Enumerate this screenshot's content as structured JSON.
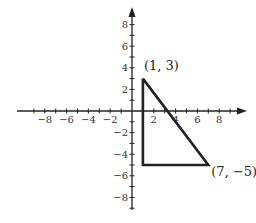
{
  "chart_data": {
    "type": "line",
    "title": "",
    "xlabel": "",
    "ylabel": "",
    "xlim": [
      -9.5,
      9.5
    ],
    "ylim": [
      -9.5,
      9.5
    ],
    "grid": false,
    "x_ticks": [
      -8,
      -6,
      -4,
      -2,
      2,
      4,
      6,
      8
    ],
    "y_ticks": [
      -8,
      -6,
      -4,
      -2,
      2,
      4,
      6,
      8
    ],
    "x_tick_labels": [
      "−8",
      "−6",
      "−4",
      "−2",
      "2",
      "4",
      "6",
      "8"
    ],
    "y_tick_labels": [
      "−8",
      "−6",
      "−4",
      "−2",
      "2",
      "4",
      "6",
      "8"
    ],
    "series": [
      {
        "name": "triangle",
        "points": [
          [
            1,
            3
          ],
          [
            7,
            -5
          ],
          [
            1,
            -5
          ],
          [
            1,
            3
          ]
        ],
        "color": "#222222"
      }
    ],
    "annotations": [
      {
        "text": "(1, 3)",
        "x": 1,
        "y": 3
      },
      {
        "text": "(7, −5)",
        "x": 7,
        "y": -5
      }
    ]
  }
}
